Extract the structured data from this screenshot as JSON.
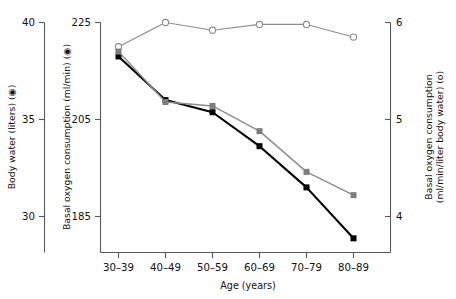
{
  "chart_data": {
    "type": "line",
    "title": "",
    "categories": [
      "30–39",
      "40–49",
      "50–59",
      "60–69",
      "70–79",
      "80–89"
    ],
    "xlabel": "Age (years)",
    "axes": {
      "left_outer": {
        "label": "Body water (liters) (◉)",
        "ticks": [
          "40",
          "35",
          "30"
        ],
        "values": [
          40,
          35,
          30
        ],
        "ylim": [
          27.9,
          40
        ]
      },
      "left_inner": {
        "label": "Basal oxygen consumption (ml/min) (◉)",
        "ticks": [
          "225",
          "205",
          "185"
        ],
        "values": [
          225,
          205,
          185
        ],
        "ylim": [
          179,
          225
        ]
      },
      "right": {
        "label": "Basal oxygen consumption (ml/min/liter body water) (o)",
        "label_line1": "Basal oxygen consumption",
        "label_line2": "(ml/min/liter body water) (o)",
        "ticks": [
          "6",
          "5",
          "4"
        ],
        "values": [
          6,
          5,
          4
        ],
        "ylim": [
          3.75,
          6.05
        ]
      }
    },
    "grid": false,
    "legend_position": "inline-axis-labels",
    "series": [
      {
        "name": "Basal oxygen consumption per liter body water",
        "marker": "open-circle",
        "color": "#8d8d8d",
        "axis": "right",
        "unit": "ml/min/liter body water",
        "values": [
          5.75,
          6.0,
          5.92,
          5.98,
          5.98,
          5.85
        ]
      },
      {
        "name": "Basal oxygen consumption",
        "marker": "filled-square-black",
        "color": "#000000",
        "axis": "left_inner",
        "unit": "ml/min",
        "values": [
          218.0,
          209.0,
          206.5,
          199.5,
          191.0,
          180.5
        ]
      },
      {
        "name": "Body water",
        "marker": "filled-square-gray",
        "color": "#7d7d7d",
        "axis": "left_outer",
        "unit": "liters",
        "values": [
          38.5,
          35.9,
          35.7,
          34.4,
          32.3,
          31.1
        ]
      }
    ]
  },
  "figure": {
    "background": "#ffffff",
    "accent_gray": "#8d8d8d",
    "accent_black": "#000000"
  }
}
